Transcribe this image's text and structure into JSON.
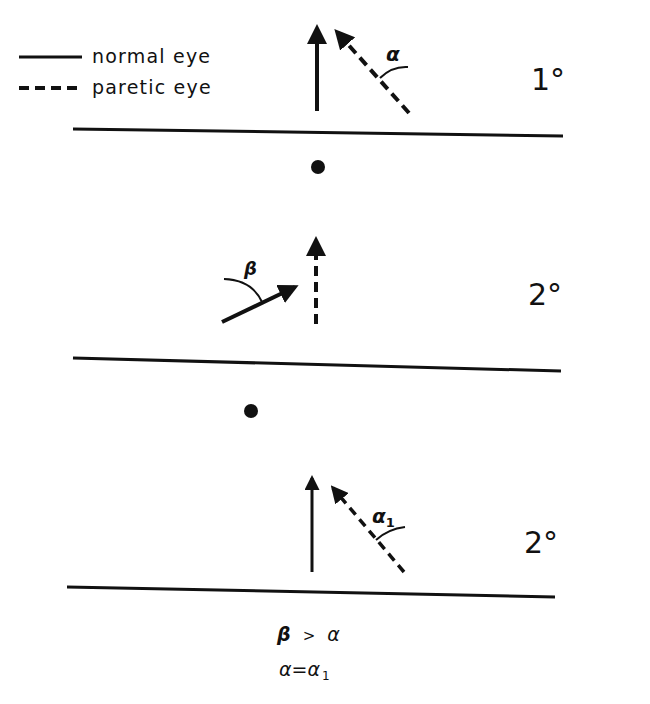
{
  "legend": {
    "items": [
      {
        "style": "solid",
        "label": "normal eye"
      },
      {
        "style": "dashed",
        "label": "paretic eye"
      }
    ]
  },
  "panels": [
    {
      "gaze": "1°",
      "fixation_dot": false,
      "angle_label": "α",
      "arrows": [
        "normal eye: vertical solid arrow",
        "paretic eye: dashed arrow tilted left by α"
      ]
    },
    {
      "gaze": "2°",
      "fixation_dot": true,
      "angle_label": "β",
      "arrows": [
        "normal eye: solid arrow tilted right by β",
        "paretic eye: vertical dashed arrow"
      ]
    },
    {
      "gaze": "2°",
      "fixation_dot": true,
      "angle_label": "α",
      "angle_subscript": "1",
      "arrows": [
        "normal eye: vertical solid arrow",
        "paretic eye: dashed arrow tilted left by α1"
      ]
    }
  ],
  "conclusions": {
    "line1": {
      "left": "β",
      "op": ">",
      "right": "α"
    },
    "line2": {
      "left": "α",
      "op": "=",
      "right": "α",
      "right_subscript": "1"
    }
  },
  "colors": {
    "ink": "#111111",
    "background": "#ffffff"
  }
}
